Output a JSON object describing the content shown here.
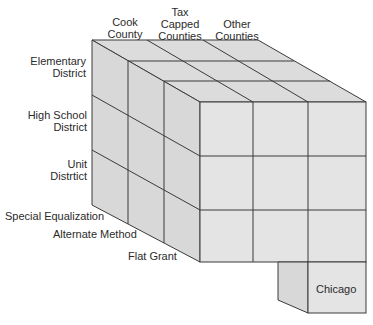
{
  "diagram": {
    "type": "3d-cube-matrix",
    "column_headers": [
      {
        "lines": [
          "Cook",
          "County"
        ]
      },
      {
        "lines": [
          "Tax",
          "Capped",
          "Counties"
        ]
      },
      {
        "lines": [
          "Other",
          "Counties"
        ]
      }
    ],
    "row_headers": [
      {
        "lines": [
          "Elementary",
          "District"
        ]
      },
      {
        "lines": [
          "High School",
          "District"
        ]
      },
      {
        "lines": [
          "Unit",
          "Distrtict"
        ]
      }
    ],
    "depth_headers": [
      "Special Equalization",
      "Alternate Method",
      "Flat Grant"
    ],
    "extra_block_label": "Chicago",
    "colors": {
      "face_fill": "#e3e3e3",
      "side_fill": "#d9d9d9",
      "top_fill": "#dcdcdc",
      "line": "#3a3a3a"
    }
  }
}
